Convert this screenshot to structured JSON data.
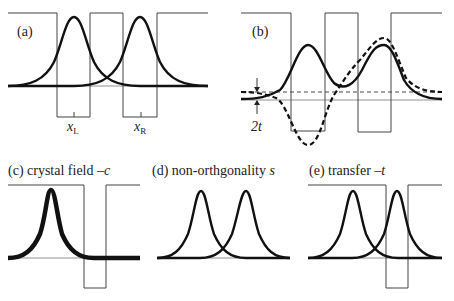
{
  "panels": {
    "a": {
      "label": "(a)",
      "x_left_label": "x",
      "x_left_sub": "L",
      "x_right_label": "x",
      "x_right_sub": "R"
    },
    "b": {
      "label": "(b)",
      "gap_label": "2t"
    },
    "c": {
      "label": "(c) crystal field –",
      "symbol": "c"
    },
    "d": {
      "label": "(d) non-orthgonality ",
      "symbol": "s"
    },
    "e": {
      "label": "(e) transfer –",
      "symbol": "t"
    }
  }
}
